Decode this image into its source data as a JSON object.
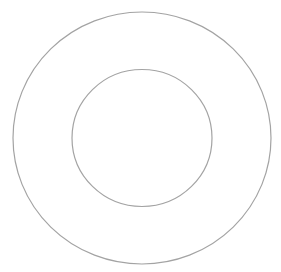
{
  "diagram": {
    "type": "concentric-circles",
    "background": "#ffffff",
    "stroke_color": "#a3a3a3",
    "stroke_width": 1.2,
    "shapes": [
      {
        "name": "outer-circle",
        "cx": 142,
        "cy": 138,
        "rx": 129,
        "ry": 126
      },
      {
        "name": "inner-circle",
        "cx": 142,
        "cy": 138,
        "rx": 70,
        "ry": 68.5
      }
    ]
  }
}
